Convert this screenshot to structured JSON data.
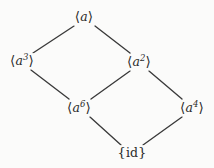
{
  "diagram": {
    "kind": "hasse-lattice",
    "title": "",
    "background_color": "#fbfbfa",
    "edge_color": "#3a3a3a",
    "text_color": "#2b2b2b",
    "width": 214,
    "height": 168,
    "nodes": [
      {
        "id": "a1",
        "label": "⟨a⟩",
        "open_bracket": "⟨",
        "generator": "a",
        "exponent": "",
        "close_bracket": "⟩",
        "x": 84,
        "y": 17
      },
      {
        "id": "a3",
        "label": "⟨a³⟩",
        "open_bracket": "⟨",
        "generator": "a",
        "exponent": "3",
        "close_bracket": "⟩",
        "x": 22,
        "y": 61
      },
      {
        "id": "a2",
        "label": "⟨a²⟩",
        "open_bracket": "⟨",
        "generator": "a",
        "exponent": "2",
        "close_bracket": "⟩",
        "x": 139,
        "y": 62
      },
      {
        "id": "a6",
        "label": "⟨a⁶⟩",
        "open_bracket": "⟨",
        "generator": "a",
        "exponent": "6",
        "close_bracket": "⟩",
        "x": 79,
        "y": 108
      },
      {
        "id": "a4",
        "label": "⟨a⁴⟩",
        "open_bracket": "⟨",
        "generator": "a",
        "exponent": "4",
        "close_bracket": "⟩",
        "x": 192,
        "y": 108
      },
      {
        "id": "id",
        "label": "{id}",
        "open_bracket": "{",
        "generator": "id",
        "exponent": "",
        "close_bracket": "}",
        "x": 132,
        "y": 153
      }
    ],
    "edges": [
      {
        "from": "a1",
        "to": "a3",
        "x1": 74,
        "y1": 26,
        "x2": 33,
        "y2": 53
      },
      {
        "from": "a1",
        "to": "a2",
        "x1": 95,
        "y1": 26,
        "x2": 130,
        "y2": 53
      },
      {
        "from": "a3",
        "to": "a6",
        "x1": 31,
        "y1": 70,
        "x2": 69,
        "y2": 99
      },
      {
        "from": "a2",
        "to": "a6",
        "x1": 130,
        "y1": 71,
        "x2": 91,
        "y2": 99
      },
      {
        "from": "a2",
        "to": "a4",
        "x1": 149,
        "y1": 71,
        "x2": 182,
        "y2": 99
      },
      {
        "from": "a6",
        "to": "id",
        "x1": 90,
        "y1": 117,
        "x2": 121,
        "y2": 145
      },
      {
        "from": "a4",
        "to": "id",
        "x1": 182,
        "y1": 117,
        "x2": 143,
        "y2": 145
      }
    ]
  }
}
